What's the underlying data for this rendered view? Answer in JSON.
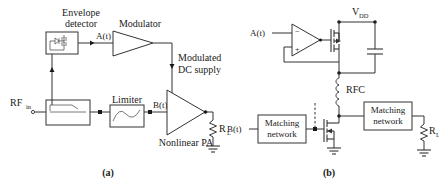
{
  "figure": {
    "background_color": "#ffffff",
    "line_color": "#333333",
    "text_color": "#1a1a1a"
  },
  "panel_a": {
    "caption": "(a)",
    "labels": {
      "envelope_detector_line1": "Envelope",
      "envelope_detector_line2": "detector",
      "modulator": "Modulator",
      "modulated_supply_line1": "Modulated",
      "modulated_supply_line2": "DC supply",
      "limiter": "Limiter",
      "nonlinear_pa": "Nonlinear PA",
      "rf_in_main": "RF",
      "rf_in_sub": "in",
      "signal_a": "A(t)",
      "signal_b": "B(t)",
      "load_main": "R",
      "load_sub": "L"
    }
  },
  "panel_b": {
    "caption": "(b)",
    "labels": {
      "supply_main": "V",
      "supply_sub": "DD",
      "signal_a": "A(t)",
      "signal_b": "B(t)",
      "rfc": "RFC",
      "matching_network_in_line1": "Matching",
      "matching_network_in_line2": "network",
      "matching_network_out_line1": "Matching",
      "matching_network_out_line2": "network",
      "opamp_minus": "−",
      "opamp_plus": "+",
      "load_main": "R",
      "load_sub": "L"
    }
  }
}
